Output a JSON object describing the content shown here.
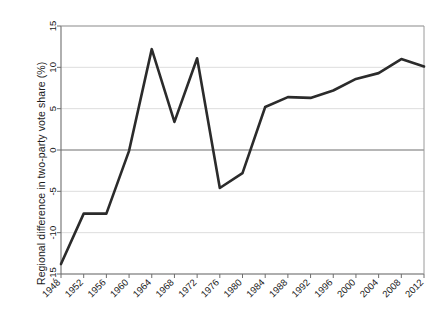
{
  "chart_data": {
    "type": "line",
    "title": "",
    "xlabel": "",
    "ylabel": "Regional difference in two-party vote share (%)",
    "x": [
      1948,
      1952,
      1956,
      1960,
      1964,
      1968,
      1972,
      1976,
      1980,
      1984,
      1988,
      1992,
      1996,
      2000,
      2004,
      2008,
      2012
    ],
    "values": [
      -13.8,
      -7.7,
      -7.7,
      -0.1,
      12.2,
      3.4,
      11.1,
      -4.6,
      -2.8,
      5.2,
      6.4,
      6.3,
      7.2,
      8.6,
      9.3,
      11.0,
      10.1
    ],
    "xtick_labels": [
      "1948",
      "1952",
      "1956",
      "1960",
      "1964",
      "1968",
      "1972",
      "1976",
      "1980",
      "1984",
      "1988",
      "1992",
      "1996",
      "2000",
      "2004",
      "2008",
      "2012"
    ],
    "ytick_labels": [
      "15",
      "10",
      "5",
      "0",
      "-5",
      "-10",
      "-15"
    ],
    "ytick_values": [
      15,
      10,
      5,
      0,
      -5,
      -10,
      -15
    ],
    "ylim": [
      -15,
      15
    ],
    "xlim": [
      1948,
      2012
    ],
    "grid": true,
    "legend": "none",
    "line_color": "#2b2b2b",
    "grid_color": "#d9d9d9",
    "zero_line_color": "#6e6e6e",
    "axis_color": "#808080"
  }
}
